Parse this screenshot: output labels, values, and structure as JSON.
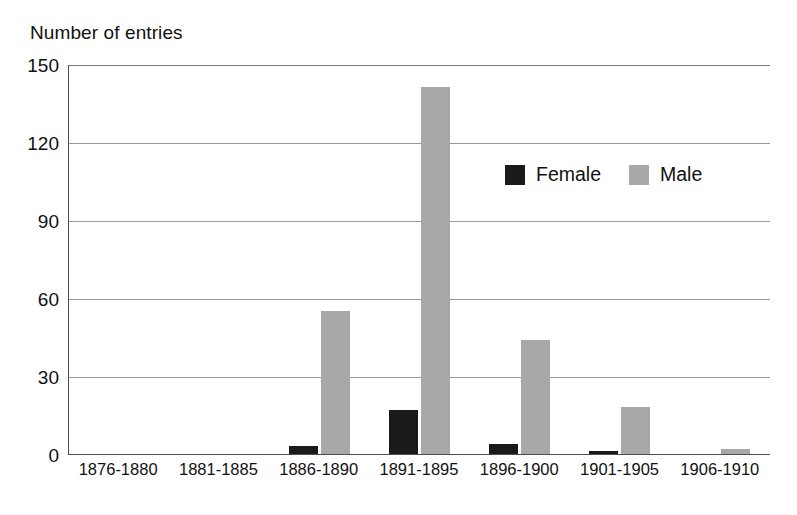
{
  "chart_data": {
    "type": "bar",
    "title": "",
    "ylabel": "Number of entries",
    "xlabel": "",
    "ylim": [
      0,
      150
    ],
    "yticks": [
      0,
      30,
      60,
      90,
      120,
      150
    ],
    "grid": true,
    "legend_position": "inside-upper-right",
    "categories": [
      "1876-1880",
      "1881-1885",
      "1886-1890",
      "1891-1895",
      "1896-1900",
      "1901-1905",
      "1906-1910"
    ],
    "series": [
      {
        "name": "Female",
        "color": "#1a1a1a",
        "values": [
          0,
          0,
          3,
          17,
          4,
          1,
          0
        ]
      },
      {
        "name": "Male",
        "color": "#a8a8a8",
        "values": [
          0,
          0,
          55,
          141,
          44,
          18,
          2
        ]
      }
    ]
  },
  "axis": {
    "y_title": "Number of entries",
    "y_tick_labels": [
      "150",
      "120",
      "90",
      "60",
      "30",
      "0"
    ]
  },
  "legend": {
    "entries": [
      {
        "label": "Female",
        "swatch": "legend-swatch-black"
      },
      {
        "label": "Male",
        "swatch": "legend-swatch-gray"
      }
    ]
  }
}
